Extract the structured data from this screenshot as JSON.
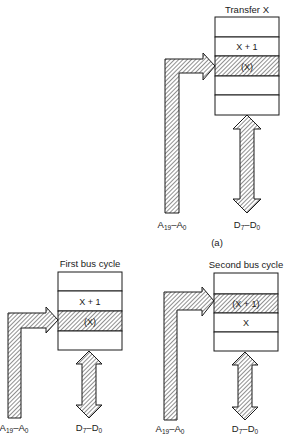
{
  "diagrams": [
    {
      "id": "transfer",
      "title": "Transfer X",
      "rows": [
        "",
        "X + 1",
        "(X)",
        "",
        ""
      ],
      "highlighted_row": 2,
      "address_label": {
        "main": "A",
        "sub1": "19",
        "dash": "–A",
        "sub2": "0"
      },
      "data_label": {
        "main": "D",
        "sub1": "7",
        "dash": "–D",
        "sub2": "0"
      }
    },
    {
      "id": "first-cycle",
      "title": "First bus cycle",
      "rows": [
        "",
        "X + 1",
        "(X)",
        ""
      ],
      "highlighted_row": 2,
      "address_label": {
        "main": "A",
        "sub1": "19",
        "dash": "–A",
        "sub2": "0"
      },
      "data_label": {
        "main": "D",
        "sub1": "7",
        "dash": "–D",
        "sub2": "0"
      }
    },
    {
      "id": "second-cycle",
      "title": "Second bus cycle",
      "rows": [
        "",
        "(X + 1)",
        "X",
        ""
      ],
      "highlighted_row": 1,
      "address_label": {
        "main": "A",
        "sub1": "19",
        "dash": "–A",
        "sub2": "0"
      },
      "data_label": {
        "main": "D",
        "sub1": "7",
        "dash": "–D",
        "sub2": "0"
      }
    }
  ],
  "caption": "(a)"
}
